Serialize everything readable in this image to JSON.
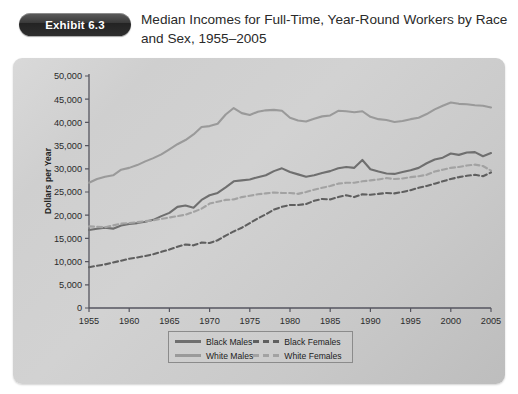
{
  "header": {
    "badge": "Exhibit 6.3",
    "title": "Median Incomes for Full-Time, Year-Round Workers by Race and Sex, 1955–2005"
  },
  "colors": {
    "black_males": "#6f6f6f",
    "white_males": "#9a9a9a",
    "black_females": "#5f5f5f",
    "white_females": "#a2a2a2",
    "axis": "#55555f",
    "panel_bg": "#d2d2d2",
    "badge_bg": "#2b2b2b",
    "text": "#2a2a2a"
  },
  "legend": {
    "position": "bottom-center",
    "entries": [
      {
        "label": "Black Males",
        "style": "solid",
        "color": "#6f6f6f"
      },
      {
        "label": "White Males",
        "style": "solid",
        "color": "#9a9a9a"
      },
      {
        "label": "Black Females",
        "style": "dashed",
        "color": "#5f5f5f"
      },
      {
        "label": "White Females",
        "style": "dashed",
        "color": "#a2a2a2"
      }
    ]
  },
  "chart_data": {
    "type": "line",
    "title": "Median Incomes for Full-Time, Year-Round Workers by Race and Sex, 1955–2005",
    "xlabel": "",
    "ylabel": "Dollars per Year",
    "xlim": [
      1955,
      2005
    ],
    "ylim": [
      0,
      50000
    ],
    "xticks": [
      1955,
      1960,
      1965,
      1970,
      1975,
      1980,
      1985,
      1990,
      1995,
      2000,
      2005
    ],
    "xticklabels": [
      "1955",
      "1960",
      "1965",
      "1970",
      "1975",
      "1980",
      "1985",
      "1990",
      "1995",
      "2000",
      "2005"
    ],
    "yticks": [
      0,
      5000,
      10000,
      15000,
      20000,
      25000,
      30000,
      35000,
      40000,
      45000,
      50000
    ],
    "yticklabels": [
      "0",
      "5,000",
      "10,000",
      "15,000",
      "20,000",
      "25,000",
      "30,000",
      "35,000",
      "40,000",
      "45,000",
      "50,000"
    ],
    "grid": false,
    "legend": true,
    "x": [
      1955,
      1956,
      1957,
      1958,
      1959,
      1960,
      1961,
      1962,
      1963,
      1964,
      1965,
      1966,
      1967,
      1968,
      1969,
      1970,
      1971,
      1972,
      1973,
      1974,
      1975,
      1976,
      1977,
      1978,
      1979,
      1980,
      1981,
      1982,
      1983,
      1984,
      1985,
      1986,
      1987,
      1988,
      1989,
      1990,
      1991,
      1992,
      1993,
      1994,
      1995,
      1996,
      1997,
      1998,
      1999,
      2000,
      2001,
      2002,
      2003,
      2004,
      2005
    ],
    "series": [
      {
        "name": "White Males",
        "style": "solid",
        "color": "#9a9a9a",
        "values": [
          27000,
          27800,
          28300,
          28600,
          29800,
          30200,
          30800,
          31600,
          32300,
          33100,
          34200,
          35300,
          36200,
          37400,
          39000,
          39200,
          39700,
          41700,
          43100,
          42000,
          41600,
          42300,
          42600,
          42700,
          42500,
          41000,
          40400,
          40200,
          40800,
          41300,
          41500,
          42500,
          42400,
          42200,
          42400,
          41200,
          40700,
          40500,
          40100,
          40300,
          40700,
          41000,
          41800,
          42800,
          43600,
          44300,
          44000,
          43900,
          43700,
          43600,
          43200
        ]
      },
      {
        "name": "Black Males",
        "style": "solid",
        "color": "#6f6f6f",
        "values": [
          16800,
          17100,
          17300,
          17100,
          17800,
          18100,
          18300,
          18600,
          19000,
          19800,
          20500,
          21800,
          22100,
          21600,
          23300,
          24300,
          24800,
          26000,
          27300,
          27500,
          27700,
          28200,
          28600,
          29500,
          30100,
          29300,
          28800,
          28300,
          28600,
          29100,
          29500,
          30100,
          30400,
          30200,
          31900,
          29900,
          29400,
          29000,
          28900,
          29300,
          29700,
          30200,
          31200,
          32000,
          32400,
          33300,
          33000,
          33500,
          33600,
          32700,
          33400
        ]
      },
      {
        "name": "White Females",
        "style": "dashed",
        "color": "#a2a2a2",
        "values": [
          17600,
          17500,
          17400,
          17800,
          18200,
          18300,
          18500,
          18700,
          18900,
          19200,
          19500,
          19800,
          20100,
          20700,
          21400,
          22500,
          22900,
          23300,
          23400,
          23900,
          24200,
          24500,
          24700,
          24900,
          24800,
          24800,
          24600,
          25000,
          25500,
          25900,
          26300,
          26800,
          27000,
          27000,
          27300,
          27500,
          27700,
          28000,
          27800,
          27900,
          28200,
          28400,
          28700,
          29400,
          29800,
          30200,
          30400,
          30700,
          30900,
          30600,
          29600
        ]
      },
      {
        "name": "Black Females",
        "style": "dashed",
        "color": "#5f5f5f",
        "values": [
          8800,
          9100,
          9400,
          9800,
          10200,
          10600,
          10900,
          11200,
          11600,
          12100,
          12600,
          13200,
          13700,
          13500,
          14100,
          14000,
          14600,
          15600,
          16500,
          17300,
          18300,
          19300,
          20200,
          21200,
          21800,
          22200,
          22200,
          22400,
          23100,
          23500,
          23400,
          23900,
          24300,
          23900,
          24500,
          24400,
          24600,
          24800,
          24700,
          25000,
          25400,
          25900,
          26300,
          26800,
          27300,
          27800,
          28200,
          28500,
          28700,
          28400,
          29200
        ]
      }
    ]
  }
}
